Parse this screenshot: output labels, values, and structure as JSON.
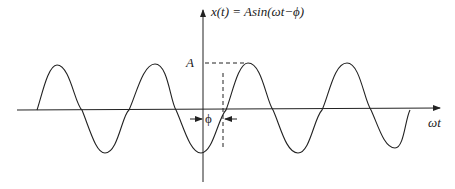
{
  "figure": {
    "equation": "x(t) = Asin(ωt−ϕ)",
    "amplitude_label": "A",
    "phase_label": "ϕ",
    "x_axis_label": "ωt"
  },
  "colors": {
    "stroke": "#222222",
    "background": "#ffffff"
  }
}
